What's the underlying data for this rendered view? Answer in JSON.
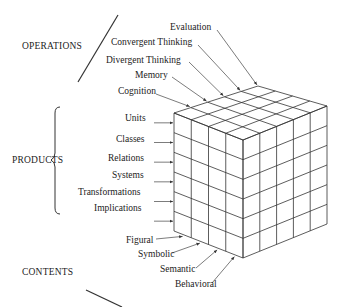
{
  "diagram": {
    "dimensions": {
      "operations": {
        "label": "OPERATIONS",
        "items": [
          "Evaluation",
          "Convergent Thinking",
          "Divergent Thinking",
          "Memory",
          "Cognition"
        ]
      },
      "products": {
        "label": "PRODUCTS",
        "items": [
          "Units",
          "Classes",
          "Relations",
          "Systems",
          "Transformations",
          "Implications"
        ]
      },
      "contents": {
        "label": "CONTENTS",
        "items": [
          "Figural",
          "Symbolic",
          "Semantic",
          "Behavioral"
        ]
      }
    },
    "cube": {
      "contents_cols": 4,
      "operations_cols": 5,
      "products_rows": 6,
      "line_color": "#333333"
    }
  }
}
